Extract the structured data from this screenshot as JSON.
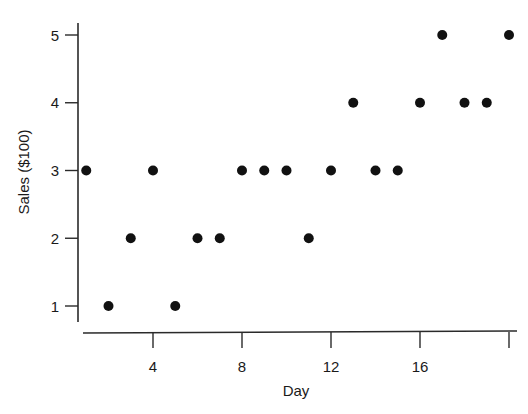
{
  "chart_data": {
    "type": "scatter",
    "title": "",
    "xlabel": "Day",
    "ylabel": "Sales ($100)",
    "x_ticks": [
      4,
      8,
      12,
      16,
      20
    ],
    "x_tick_labels": [
      "4",
      "8",
      "12",
      "16",
      ""
    ],
    "y_ticks": [
      1,
      2,
      3,
      4,
      5
    ],
    "y_tick_labels": [
      "1",
      "2",
      "3",
      "4",
      "5"
    ],
    "xlim": [
      0,
      20
    ],
    "ylim": [
      1,
      5
    ],
    "grid": false,
    "legend": null,
    "marker_color": "#111111",
    "series": [
      {
        "name": "Sales",
        "points": [
          {
            "x": 1,
            "y": 3
          },
          {
            "x": 2,
            "y": 1
          },
          {
            "x": 3,
            "y": 2
          },
          {
            "x": 4,
            "y": 3
          },
          {
            "x": 5,
            "y": 1
          },
          {
            "x": 6,
            "y": 2
          },
          {
            "x": 7,
            "y": 2
          },
          {
            "x": 8,
            "y": 3
          },
          {
            "x": 9,
            "y": 3
          },
          {
            "x": 10,
            "y": 3
          },
          {
            "x": 11,
            "y": 2
          },
          {
            "x": 12,
            "y": 3
          },
          {
            "x": 13,
            "y": 4
          },
          {
            "x": 14,
            "y": 3
          },
          {
            "x": 15,
            "y": 3
          },
          {
            "x": 16,
            "y": 4
          },
          {
            "x": 17,
            "y": 5
          },
          {
            "x": 18,
            "y": 4
          },
          {
            "x": 19,
            "y": 4
          },
          {
            "x": 20,
            "y": 5
          }
        ]
      }
    ]
  }
}
